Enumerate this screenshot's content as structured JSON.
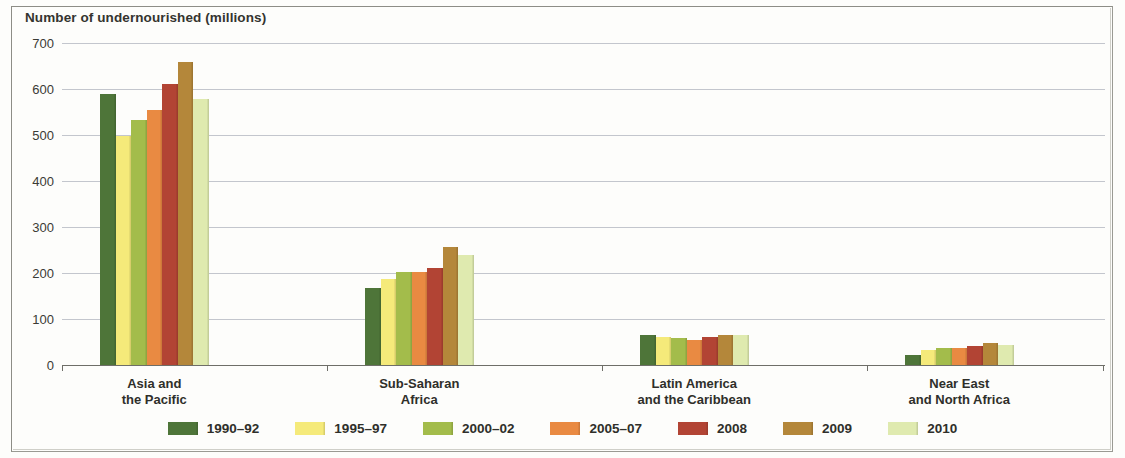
{
  "chart_data": {
    "type": "bar",
    "title": "Number of undernourished (millions)",
    "xlabel": "",
    "ylabel": "Number of undernourished (millions)",
    "ylim": [
      0,
      700
    ],
    "ytick_values": [
      700,
      600,
      500,
      400,
      300,
      200,
      100,
      0
    ],
    "ytick_labels": [
      "700",
      "600",
      "500",
      "400",
      "300",
      "200",
      "100",
      "0"
    ],
    "grid": true,
    "legend_position": "bottom",
    "categories": [
      "Asia and\nthe Pacific",
      "Sub-Saharan\nAfrica",
      "Latin America\nand the Caribbean",
      "Near East\nand North Africa"
    ],
    "series": [
      {
        "name": "1990–92",
        "color": "#4e7539",
        "values": [
          589,
          168,
          65,
          21
        ]
      },
      {
        "name": "1995–97",
        "color": "#f5ea7a",
        "values": [
          498,
          188,
          60,
          32
        ]
      },
      {
        "name": "2000–02",
        "color": "#a3bc4b",
        "values": [
          532,
          203,
          59,
          38
        ]
      },
      {
        "name": "2005–07",
        "color": "#e98a42",
        "values": [
          554,
          202,
          54,
          38
        ]
      },
      {
        "name": "2008",
        "color": "#b24434",
        "values": [
          610,
          210,
          60,
          42
        ]
      },
      {
        "name": "2009",
        "color": "#b4873a",
        "values": [
          659,
          256,
          65,
          47
        ]
      },
      {
        "name": "2010",
        "color": "#dfeaaf",
        "values": [
          578,
          239,
          65,
          44
        ]
      }
    ]
  },
  "axis": {
    "title": "Number of undernourished (millions)"
  },
  "categories": [
    {
      "line1": "Asia and",
      "line2": "the Pacific"
    },
    {
      "line1": "Sub-Saharan",
      "line2": "Africa"
    },
    {
      "line1": "Latin America",
      "line2": "and the Caribbean"
    },
    {
      "line1": "Near East",
      "line2": "and North Africa"
    }
  ],
  "legend": [
    {
      "label": "1990–92"
    },
    {
      "label": "1995–97"
    },
    {
      "label": "2000–02"
    },
    {
      "label": "2005–07"
    },
    {
      "label": "2008"
    },
    {
      "label": "2009"
    },
    {
      "label": "2010"
    }
  ]
}
